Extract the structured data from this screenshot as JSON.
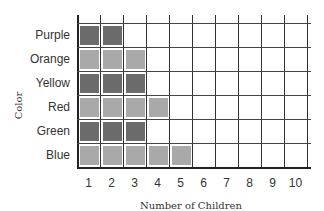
{
  "chart_data": {
    "type": "bar",
    "orientation": "horizontal",
    "style": "pictograph-grid",
    "title": "",
    "xlabel": "Number of Children",
    "ylabel": "Color",
    "categories": [
      "Purple",
      "Orange",
      "Yellow",
      "Red",
      "Green",
      "Blue"
    ],
    "values": [
      2,
      3,
      3,
      4,
      3,
      5
    ],
    "x_ticks": [
      "1",
      "2",
      "3",
      "4",
      "5",
      "6",
      "7",
      "8",
      "9",
      "10"
    ],
    "xlim": [
      0,
      10
    ],
    "grid": true,
    "legend": null,
    "colors": {
      "dark": "#6b6b6b",
      "light": "#a9a9a9"
    },
    "row_shades": [
      "dark",
      "light",
      "dark",
      "light",
      "dark",
      "light"
    ]
  }
}
